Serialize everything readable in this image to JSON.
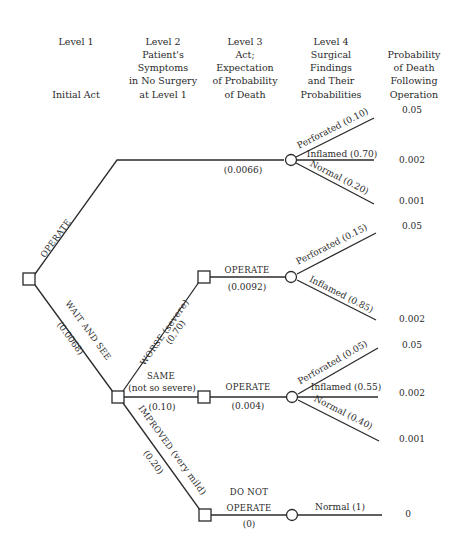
{
  "headers": {
    "level1": {
      "line1": "Level 1",
      "line2": "Initial Act"
    },
    "level2": {
      "lines": [
        "Level 2",
        "Patient's",
        "Symptoms",
        "in No Surgery",
        "at Level 1"
      ]
    },
    "level3": {
      "lines": [
        "Level 3",
        "Act;",
        "Expectation",
        "of Probability",
        "of Death"
      ]
    },
    "level4": {
      "lines": [
        "Level 4",
        "Surgical",
        "Findings",
        "and Their",
        "Probabilities"
      ]
    },
    "level5": {
      "lines": [
        "Probability",
        "of Death",
        "Following",
        "Operation"
      ]
    }
  },
  "tree": {
    "root": {
      "operate_label": "OPERATE",
      "wait_label": "WAIT AND SEE",
      "wait_value": "(0.0068)"
    },
    "operate_branch": {
      "expectation": "(0.0066)",
      "findings": [
        {
          "name": "Perforated",
          "prob": "(0.10)",
          "death": "0.05"
        },
        {
          "name": "Inflamed",
          "prob": "(0.70)",
          "death": "0.002"
        },
        {
          "name": "Normal",
          "prob": "(0.20)",
          "death": "0.001"
        }
      ]
    },
    "worse_branch": {
      "symptom": "WORSE",
      "symptom_note": "(severe)",
      "prob": "(0.70)",
      "act": "OPERATE",
      "expectation": "(0.0092)",
      "findings": [
        {
          "name": "Perforated",
          "prob": "(0.15)",
          "death": "0.05"
        },
        {
          "name": "Inflamed",
          "prob": "(0.85)",
          "death": "0.002"
        }
      ]
    },
    "same_branch": {
      "symptom": "SAME",
      "symptom_note": "(not so severe)",
      "prob": "(0.10)",
      "act": "OPERATE",
      "expectation": "(0.004)",
      "findings": [
        {
          "name": "Perforated",
          "prob": "(0.05)",
          "death": "0.05"
        },
        {
          "name": "Inflamed",
          "prob": "(0.55)",
          "death": "0.002"
        },
        {
          "name": "Normal",
          "prob": "(0.40)",
          "death": "0.001"
        }
      ]
    },
    "improved_branch": {
      "symptom": "IMPROVED",
      "symptom_note": "(very mild)",
      "prob": "(0.20)",
      "act_line1": "DO NOT",
      "act_line2": "OPERATE",
      "expectation": "(0)",
      "findings": [
        {
          "name": "Normal",
          "prob": "(1)",
          "death": "0"
        }
      ]
    }
  },
  "colors": {
    "ink": "#2a2a2a",
    "background": "#ffffff"
  }
}
